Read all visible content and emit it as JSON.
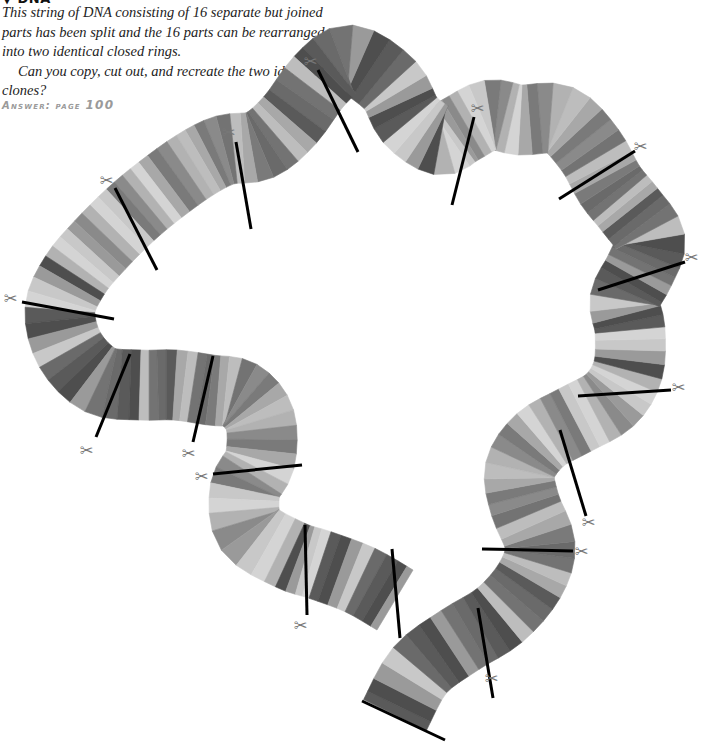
{
  "puzzle": {
    "heading": "▼ DNA",
    "paragraphs": [
      "This string of DNA consisting of 16 separate but joined parts has been split and the 16 parts can be rearranged into two identical closed rings.",
      "Can you copy, cut out, and recreate the two identical clones?"
    ],
    "answer_label": "Answer: page",
    "answer_page": "100"
  },
  "strand": {
    "parts_count": 16,
    "cut_marks": 16,
    "scissors_icon": "✂",
    "width": 70,
    "grays": [
      "#5a5a5a",
      "#7a7a7a",
      "#9a9a9a",
      "#bdbdbd",
      "#d4d4d4",
      "#6a6a6a",
      "#8a8a8a",
      "#4e4e4e",
      "#a8a8a8",
      "#c8c8c8",
      "#737373",
      "#b2b2b2"
    ],
    "centerline": [
      [
        395,
        715
      ],
      [
        420,
        670
      ],
      [
        460,
        640
      ],
      [
        500,
        615
      ],
      [
        530,
        580
      ],
      [
        540,
        545
      ],
      [
        525,
        505
      ],
      [
        520,
        470
      ],
      [
        540,
        440
      ],
      [
        575,
        420
      ],
      [
        610,
        400
      ],
      [
        628,
        370
      ],
      [
        630,
        330
      ],
      [
        625,
        300
      ],
      [
        640,
        270
      ],
      [
        650,
        240
      ],
      [
        630,
        210
      ],
      [
        610,
        185
      ],
      [
        590,
        150
      ],
      [
        560,
        120
      ],
      [
        520,
        120
      ],
      [
        490,
        115
      ],
      [
        460,
        130
      ],
      [
        440,
        140
      ],
      [
        410,
        120
      ],
      [
        390,
        85
      ],
      [
        350,
        60
      ],
      [
        320,
        80
      ],
      [
        290,
        120
      ],
      [
        260,
        145
      ],
      [
        225,
        150
      ],
      [
        195,
        165
      ],
      [
        160,
        190
      ],
      [
        130,
        215
      ],
      [
        100,
        245
      ],
      [
        75,
        275
      ],
      [
        60,
        310
      ],
      [
        70,
        350
      ],
      [
        100,
        380
      ],
      [
        140,
        385
      ],
      [
        175,
        385
      ],
      [
        210,
        390
      ],
      [
        240,
        395
      ],
      [
        260,
        420
      ],
      [
        260,
        460
      ],
      [
        245,
        490
      ],
      [
        250,
        530
      ],
      [
        290,
        555
      ],
      [
        320,
        565
      ],
      [
        360,
        580
      ],
      [
        395,
        600
      ]
    ],
    "cuts": [
      {
        "x1": 362,
        "y1": 701,
        "x2": 445,
        "y2": 740
      },
      {
        "x1": 478,
        "y1": 608,
        "x2": 493,
        "y2": 698
      },
      {
        "x1": 482,
        "y1": 549,
        "x2": 573,
        "y2": 551
      },
      {
        "x1": 560,
        "y1": 430,
        "x2": 586,
        "y2": 516
      },
      {
        "x1": 578,
        "y1": 396,
        "x2": 671,
        "y2": 390
      },
      {
        "x1": 598,
        "y1": 290,
        "x2": 685,
        "y2": 262
      },
      {
        "x1": 559,
        "y1": 199,
        "x2": 635,
        "y2": 151
      },
      {
        "x1": 452,
        "y1": 205,
        "x2": 474,
        "y2": 117
      },
      {
        "x1": 318,
        "y1": 70,
        "x2": 358,
        "y2": 152
      },
      {
        "x1": 236,
        "y1": 142,
        "x2": 251,
        "y2": 229
      },
      {
        "x1": 115,
        "y1": 188,
        "x2": 157,
        "y2": 270
      },
      {
        "x1": 22,
        "y1": 302,
        "x2": 114,
        "y2": 319
      },
      {
        "x1": 96,
        "y1": 437,
        "x2": 130,
        "y2": 354
      },
      {
        "x1": 193,
        "y1": 442,
        "x2": 213,
        "y2": 356
      },
      {
        "x1": 213,
        "y1": 474,
        "x2": 302,
        "y2": 465
      },
      {
        "x1": 305,
        "y1": 525,
        "x2": 307,
        "y2": 615
      },
      {
        "x1": 392,
        "y1": 549,
        "x2": 400,
        "y2": 638
      }
    ],
    "scissors": [
      [
        493,
        678
      ],
      [
        583,
        551
      ],
      [
        590,
        522
      ],
      [
        680,
        387
      ],
      [
        693,
        257
      ],
      [
        642,
        146
      ],
      [
        479,
        108
      ],
      [
        312,
        61
      ],
      [
        230,
        132
      ],
      [
        108,
        180
      ],
      [
        12,
        298
      ],
      [
        88,
        450
      ],
      [
        190,
        453
      ],
      [
        203,
        476
      ],
      [
        302,
        625
      ]
    ]
  }
}
